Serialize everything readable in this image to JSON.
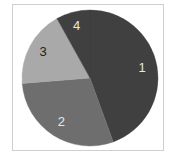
{
  "chart_data": {
    "type": "pie",
    "title": "",
    "labels": [
      "1",
      "2",
      "3",
      "4"
    ],
    "values": [
      44,
      29,
      18,
      8
    ],
    "start_angle_deg": 0,
    "direction": "clockwise",
    "colors": [
      "#404040",
      "#6e6e6e",
      "#a9a9a9",
      "#404040"
    ],
    "label_colors": [
      "#e6e6e6",
      "#e6e6e6",
      "#222222",
      "#e6e6e6"
    ],
    "legend": "none"
  }
}
